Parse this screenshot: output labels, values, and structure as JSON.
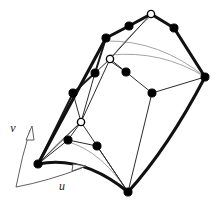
{
  "figure": {
    "caption": "",
    "background_color": "#ffffff",
    "width": 220,
    "height": 207
  },
  "colors": {
    "boundary_curve": "#111111",
    "control_polygon": "#1a1a1a",
    "interior_net": "#2b2b2b",
    "iso_curve": "#9a9a9a",
    "control_point_fill": "#000000",
    "control_point_hollow_fill": "#ffffff",
    "control_point_stroke": "#000000",
    "axis": "#4d4d4d",
    "label": "#1a1a1a"
  },
  "strokes": {
    "boundary_curve_width": 3.1,
    "control_polygon_width": 2.0,
    "interior_net_width": 1.0,
    "iso_curve_width": 0.9,
    "axis_width": 0.9
  },
  "axes": {
    "origin": {
      "x": 16,
      "y": 187
    },
    "u": {
      "label": "u",
      "label_x": 62,
      "label_y": 190,
      "arc_path": "M 16 187 Q 48 181 82 168",
      "arrow_tip": {
        "x": 84,
        "y": 167
      },
      "arrow_path": "M 72 171 L 86 166 L 73 164 Z"
    },
    "v": {
      "label": "v",
      "label_x": 13,
      "label_y": 132,
      "arc_path": "M 16 187 Q 22 156 30 130",
      "arrow_tip": {
        "x": 31,
        "y": 127
      },
      "arrow_path": "M 26 140 L 32 126 L 34 140 Z"
    }
  },
  "control_points": {
    "filled": [
      {
        "name": "cp-top-left-arm-1",
        "x": 106,
        "y": 38
      },
      {
        "name": "cp-top-left-arm-2",
        "x": 129,
        "y": 26
      },
      {
        "name": "cp-top-right-arm-1",
        "x": 174,
        "y": 28
      },
      {
        "name": "cp-right-vertex",
        "x": 205,
        "y": 77
      },
      {
        "name": "cp-left-edge-1",
        "x": 95,
        "y": 73
      },
      {
        "name": "cp-left-edge-2",
        "x": 73,
        "y": 93
      },
      {
        "name": "cp-bottom-left-vertex",
        "x": 38,
        "y": 164
      },
      {
        "name": "cp-bottom-vertex",
        "x": 128,
        "y": 192
      },
      {
        "name": "cp-interior-mid-right",
        "x": 152,
        "y": 93
      },
      {
        "name": "cp-interior-mid-left",
        "x": 126,
        "y": 72
      },
      {
        "name": "cp-interior-lower-left",
        "x": 68,
        "y": 140
      },
      {
        "name": "cp-interior-lower-right",
        "x": 97,
        "y": 146
      }
    ],
    "hollow": [
      {
        "name": "cp-apex",
        "x": 151,
        "y": 14
      },
      {
        "name": "cp-interior-upper",
        "x": 110,
        "y": 59
      },
      {
        "name": "cp-interior-lower",
        "x": 81,
        "y": 122
      }
    ],
    "filled_radius": 4.1,
    "hollow_radius": 3.6
  },
  "curves": {
    "boundary": [
      {
        "name": "boundary-top-left",
        "path": "M 38 164 L 106 38 L 129 26 L 151 14"
      },
      {
        "name": "boundary-top-right",
        "path": "M 151 14 L 174 28 L 205 77"
      },
      {
        "name": "boundary-bottom-left-arc",
        "path": "M 38 164 Q 83 155 128 192"
      },
      {
        "name": "boundary-bottom-right-arc",
        "path": "M 128 192 Q 168 148 205 77"
      }
    ],
    "control_polygon": [
      {
        "name": "polygon-left-chain",
        "path": "M 38 164 L 73 93 L 95 73 L 106 38"
      }
    ],
    "interior_net": [
      {
        "name": "net-apex-to-upper",
        "path": "M 151 14 L 110 59"
      },
      {
        "name": "net-upper-to-lower",
        "path": "M 110 59 L 81 122"
      },
      {
        "name": "net-lower-to-bottom",
        "path": "M 81 122 L 128 192"
      },
      {
        "name": "net-upper-to-midleft",
        "path": "M 110 59 L 126 72"
      },
      {
        "name": "net-midleft-to-midright",
        "path": "M 126 72 L 152 93"
      },
      {
        "name": "net-midright-to-right",
        "path": "M 152 93 L 205 77"
      },
      {
        "name": "net-midright-to-bottom",
        "path": "M 152 93 L 128 192"
      },
      {
        "name": "net-upper-to-leftedge",
        "path": "M 110 59 L 95 73"
      },
      {
        "name": "net-leftedge-to-lower",
        "path": "M 95 73 L 81 122"
      },
      {
        "name": "net-lower-to-ll",
        "path": "M 81 122 L 68 140"
      },
      {
        "name": "net-ll-to-lr",
        "path": "M 68 140 L 97 146"
      },
      {
        "name": "net-lr-to-bottom",
        "path": "M 97 146 L 128 192"
      },
      {
        "name": "net-ll-to-bottomleft",
        "path": "M 68 140 L 38 164"
      },
      {
        "name": "net-lower-to-bottomleft",
        "path": "M 81 122 L 38 164"
      },
      {
        "name": "net-leftedge2-to-lower",
        "path": "M 73 93 L 81 122"
      },
      {
        "name": "net-highlight-horizontal",
        "path": "M 110 61 L 126 72"
      }
    ],
    "iso_curves": [
      {
        "name": "iso-upper-long",
        "path": "M 106 41 Q 160 40 205 77"
      },
      {
        "name": "iso-upper-inner",
        "path": "M 110 55 Q 162 50 205 77"
      },
      {
        "name": "iso-apex-sweep",
        "path": "M 151 16 Q 128 36 110 59"
      },
      {
        "name": "iso-lower-left",
        "path": "M 38 164 Q 58 142 81 122"
      },
      {
        "name": "iso-bottom-inner",
        "path": "M 68 142 Q 100 150 128 192"
      }
    ]
  }
}
